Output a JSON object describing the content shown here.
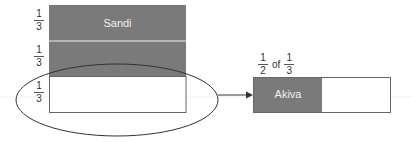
{
  "diagram": {
    "left_bar": {
      "segments": [
        {
          "fraction": {
            "num": "1",
            "den": "3"
          },
          "label": "Sandi",
          "shaded": true
        },
        {
          "fraction": {
            "num": "1",
            "den": "3"
          },
          "label": "",
          "shaded": true
        },
        {
          "fraction": {
            "num": "1",
            "den": "3"
          },
          "label": "",
          "shaded": false
        }
      ]
    },
    "right_bar": {
      "caption": {
        "num1": "1",
        "den1": "2",
        "word": "of",
        "num2": "1",
        "den2": "3"
      },
      "segments": [
        {
          "label": "Akiva",
          "shaded": true
        },
        {
          "label": "",
          "shaded": false
        }
      ]
    },
    "colors": {
      "shaded": "#7a7a7a",
      "divider": "#c8c8c8",
      "outline": "#555555",
      "ellipse": "#333333"
    }
  }
}
